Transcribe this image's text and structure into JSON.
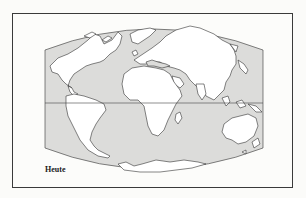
{
  "figure": {
    "type": "world-map",
    "projection": "curved-edge (pseudo-cylindrical)",
    "label": "Heute",
    "equator_shown": true
  },
  "colors": {
    "ocean": "#dcdcda",
    "land": "#ffffff",
    "coastline": "#333333",
    "frame": "#3a3a3a",
    "background": "#fbfbf9"
  },
  "regions": [
    "North America",
    "South America",
    "Greenland",
    "Europe",
    "Africa",
    "Asia",
    "Australia",
    "Antarctica",
    "Madagascar",
    "Japan",
    "Indonesia",
    "New Zealand"
  ]
}
